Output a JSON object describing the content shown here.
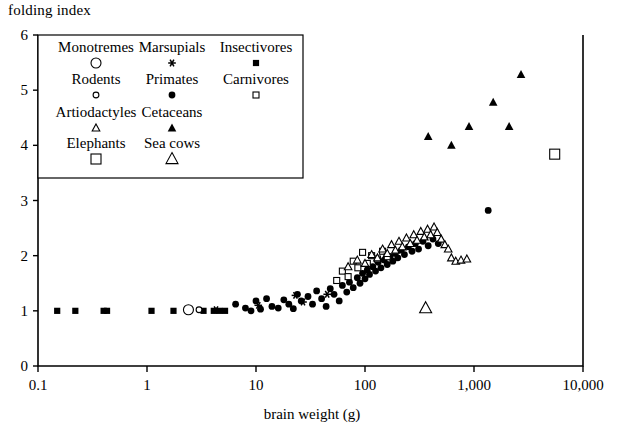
{
  "chart_data": {
    "type": "scatter",
    "title": "",
    "xlabel": "brain weight (g)",
    "ylabel": "folding index",
    "xscale": "log",
    "yscale": "linear",
    "xlim": [
      0.1,
      10000
    ],
    "ylim": [
      0,
      6
    ],
    "xticks": [
      0.1,
      1,
      10,
      100,
      1000,
      10000
    ],
    "xticklabels": [
      "0.1",
      "1",
      "10",
      "100",
      "1,000",
      "10,000"
    ],
    "yticks": [
      0,
      1,
      2,
      3,
      4,
      5,
      6
    ],
    "yticklabels": [
      "0",
      "1",
      "2",
      "3",
      "4",
      "5",
      "6"
    ],
    "grid": false,
    "legend_position": "upper-left-inset",
    "legend_title": "",
    "series": [
      {
        "name": "Monotremes",
        "marker": "open-circle-large",
        "points": [
          [
            2.4,
            1.02
          ]
        ]
      },
      {
        "name": "Marsupials",
        "marker": "asterisk",
        "points": [
          [
            4.3,
            1.02
          ],
          [
            10.5,
            1.1
          ],
          [
            23.0,
            1.28
          ],
          [
            27.0,
            1.16
          ],
          [
            45.0,
            1.3
          ]
        ]
      },
      {
        "name": "Insectivores",
        "marker": "filled-square",
        "points": [
          [
            0.15,
            1.0
          ],
          [
            0.22,
            1.0
          ],
          [
            0.4,
            1.0
          ],
          [
            0.43,
            1.0
          ],
          [
            1.1,
            1.0
          ],
          [
            1.75,
            1.0
          ],
          [
            3.3,
            1.0
          ],
          [
            4.1,
            1.0
          ],
          [
            4.6,
            1.0
          ],
          [
            5.2,
            1.0
          ]
        ]
      },
      {
        "name": "Rodents",
        "marker": "open-circle-small",
        "points": [
          [
            3.0,
            1.02
          ]
        ]
      },
      {
        "name": "Primates",
        "marker": "filled-circle",
        "points": [
          [
            6.5,
            1.12
          ],
          [
            8.0,
            1.05
          ],
          [
            9.0,
            1.0
          ],
          [
            10.0,
            1.18
          ],
          [
            11.0,
            1.03
          ],
          [
            12.5,
            1.22
          ],
          [
            14.0,
            1.08
          ],
          [
            16.0,
            1.05
          ],
          [
            18.0,
            1.2
          ],
          [
            20.0,
            1.12
          ],
          [
            22.0,
            1.04
          ],
          [
            24.0,
            1.3
          ],
          [
            26.0,
            1.18
          ],
          [
            30.0,
            1.26
          ],
          [
            33.0,
            1.12
          ],
          [
            36.0,
            1.36
          ],
          [
            40.0,
            1.22
          ],
          [
            44.0,
            1.08
          ],
          [
            48.0,
            1.4
          ],
          [
            52.0,
            1.3
          ],
          [
            58.0,
            1.18
          ],
          [
            62.0,
            1.46
          ],
          [
            68.0,
            1.34
          ],
          [
            72.0,
            1.52
          ],
          [
            78.0,
            1.42
          ],
          [
            85.0,
            1.6
          ],
          [
            90.0,
            1.5
          ],
          [
            95.0,
            1.68
          ],
          [
            100.0,
            1.58
          ],
          [
            105.0,
            1.74
          ],
          [
            110.0,
            1.66
          ],
          [
            118.0,
            1.8
          ],
          [
            125.0,
            1.72
          ],
          [
            132.0,
            1.88
          ],
          [
            140.0,
            1.78
          ],
          [
            150.0,
            1.92
          ],
          [
            160.0,
            1.84
          ],
          [
            170.0,
            1.98
          ],
          [
            180.0,
            1.9
          ],
          [
            190.0,
            2.04
          ],
          [
            200.0,
            1.96
          ],
          [
            215.0,
            2.1
          ],
          [
            230.0,
            2.02
          ],
          [
            250.0,
            2.16
          ],
          [
            270.0,
            2.08
          ],
          [
            290.0,
            2.22
          ],
          [
            310.0,
            2.12
          ],
          [
            340.0,
            2.26
          ],
          [
            380.0,
            2.18
          ],
          [
            420.0,
            2.3
          ],
          [
            470.0,
            2.22
          ],
          [
            1350.0,
            2.82
          ]
        ]
      },
      {
        "name": "Carnivores",
        "marker": "open-square-small",
        "points": [
          [
            55.0,
            1.55
          ],
          [
            62.0,
            1.72
          ],
          [
            70.0,
            1.62
          ],
          [
            78.0,
            1.9
          ],
          [
            86.0,
            1.78
          ],
          [
            95.0,
            2.06
          ],
          [
            105.0,
            1.86
          ],
          [
            115.0,
            2.0
          ],
          [
            130.0,
            1.94
          ],
          [
            145.0,
            2.08
          ],
          [
            160.0,
            1.98
          ]
        ]
      },
      {
        "name": "Artiodactyls",
        "marker": "open-triangle-small",
        "points": [
          [
            70.0,
            1.8
          ],
          [
            85.0,
            1.92
          ],
          [
            100.0,
            1.86
          ],
          [
            115.0,
            2.02
          ],
          [
            130.0,
            1.96
          ],
          [
            145.0,
            2.12
          ],
          [
            160.0,
            2.04
          ],
          [
            175.0,
            2.2
          ],
          [
            190.0,
            2.1
          ],
          [
            205.0,
            2.26
          ],
          [
            220.0,
            2.16
          ],
          [
            240.0,
            2.32
          ],
          [
            260.0,
            2.22
          ],
          [
            280.0,
            2.38
          ],
          [
            300.0,
            2.28
          ],
          [
            325.0,
            2.44
          ],
          [
            350.0,
            2.34
          ],
          [
            375.0,
            2.48
          ],
          [
            400.0,
            2.38
          ],
          [
            430.0,
            2.52
          ],
          [
            460.0,
            2.42
          ],
          [
            500.0,
            2.3
          ],
          [
            540.0,
            2.2
          ],
          [
            580.0,
            2.12
          ],
          [
            620.0,
            1.96
          ],
          [
            680.0,
            1.9
          ],
          [
            760.0,
            1.92
          ],
          [
            860.0,
            1.94
          ]
        ]
      },
      {
        "name": "Cetaceans",
        "marker": "filled-triangle",
        "points": [
          [
            380.0,
            4.16
          ],
          [
            620.0,
            4.0
          ],
          [
            900.0,
            4.34
          ],
          [
            1500.0,
            4.78
          ],
          [
            2100.0,
            4.34
          ],
          [
            2700.0,
            5.28
          ]
        ]
      },
      {
        "name": "Elephants",
        "marker": "open-square-medium",
        "points": [
          [
            5500.0,
            3.84
          ]
        ]
      },
      {
        "name": "Sea cows",
        "marker": "open-triangle-large",
        "points": [
          [
            360.0,
            1.05
          ]
        ]
      }
    ]
  },
  "legend": {
    "entries": [
      {
        "label": "Monotremes",
        "marker": "open-circle-large"
      },
      {
        "label": "Marsupials",
        "marker": "asterisk"
      },
      {
        "label": "Insectivores",
        "marker": "filled-square"
      },
      {
        "label": "Rodents",
        "marker": "open-circle-small"
      },
      {
        "label": "Primates",
        "marker": "filled-circle"
      },
      {
        "label": "Carnivores",
        "marker": "open-square-small"
      },
      {
        "label": "Artiodactyles",
        "marker": "open-triangle-small"
      },
      {
        "label": "Cetaceans",
        "marker": "filled-triangle"
      },
      {
        "label": "Elephants",
        "marker": "open-square-medium"
      },
      {
        "label": "Sea cows",
        "marker": "open-triangle-large"
      }
    ]
  },
  "colors": {
    "ink": "#000000",
    "background": "#ffffff"
  }
}
